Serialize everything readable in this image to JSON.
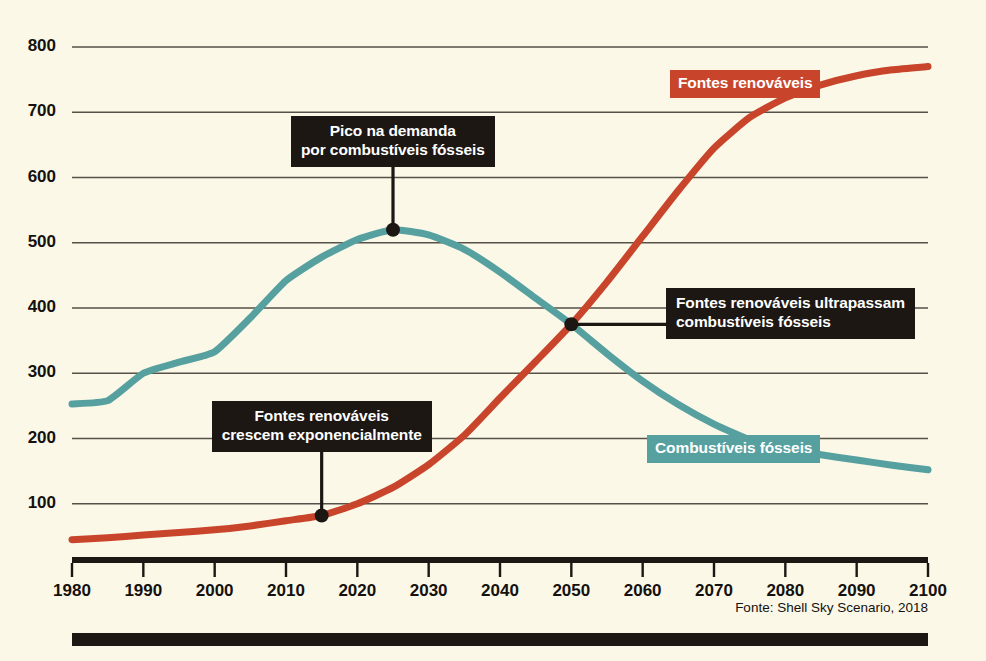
{
  "chart_data": {
    "type": "line",
    "title": "",
    "xlabel": "",
    "ylabel": "",
    "xlim": [
      1980,
      2100
    ],
    "ylim": [
      0,
      800
    ],
    "grid": true,
    "legend_position": "inline-labels",
    "x_ticks": [
      "1980",
      "1990",
      "2000",
      "2010",
      "2020",
      "2030",
      "2040",
      "2050",
      "2060",
      "2070",
      "2080",
      "2090",
      "2100"
    ],
    "y_ticks": [
      "100",
      "200",
      "300",
      "400",
      "500",
      "600",
      "700",
      "800"
    ],
    "x": [
      1980,
      1985,
      1990,
      1995,
      2000,
      2005,
      2010,
      2015,
      2020,
      2025,
      2030,
      2035,
      2040,
      2045,
      2050,
      2055,
      2060,
      2065,
      2070,
      2075,
      2080,
      2085,
      2090,
      2095,
      2100
    ],
    "series": [
      {
        "name": "Fontes renováveis",
        "color": "#c8452c",
        "values": [
          45,
          48,
          52,
          56,
          60,
          66,
          74,
          82,
          100,
          125,
          160,
          205,
          262,
          318,
          375,
          440,
          510,
          580,
          645,
          692,
          722,
          742,
          756,
          765,
          770
        ]
      },
      {
        "name": "Combustíveis fósseis",
        "color": "#56a0a0",
        "values": [
          253,
          258,
          300,
          317,
          333,
          385,
          442,
          478,
          505,
          520,
          512,
          490,
          455,
          415,
          375,
          330,
          288,
          252,
          222,
          198,
          185,
          175,
          167,
          159,
          152
        ]
      }
    ],
    "annotations": [
      {
        "id": "peak",
        "lines": "Pico na demanda\npor combustíveis fósseis",
        "point_x": 2025,
        "point_y": 520
      },
      {
        "id": "growth",
        "lines": "Fontes renováveis\ncrescem exponencialmente",
        "point_x": 2015,
        "point_y": 82
      },
      {
        "id": "crossover",
        "lines": "Fontes renováveis ultrapassam\ncombustíveis fósseis",
        "point_x": 2050,
        "point_y": 375
      }
    ]
  },
  "labels": {
    "renewables_badge": "Fontes renováveis",
    "fossil_badge": "Combustíveis fósseis"
  },
  "source": {
    "note": "Fonte: Shell Sky Scenario, 2018"
  },
  "colors": {
    "background": "#fbf8e8",
    "renewables": "#c8452c",
    "fossil": "#56a0a0",
    "ink": "#1c1713",
    "grid": "#565149"
  }
}
